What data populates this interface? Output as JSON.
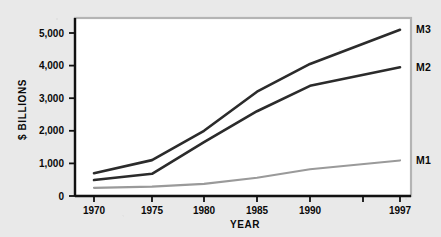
{
  "chart_data": {
    "type": "line",
    "title": "",
    "xlabel": "YEAR",
    "ylabel": "$ BILLIONS",
    "x": [
      1970,
      1975,
      1980,
      1985,
      1990,
      1997
    ],
    "categories": [
      "1970",
      "1975",
      "1980",
      "1985",
      "1990",
      "1997"
    ],
    "xtick_labels": [
      "1970",
      "1975",
      "1980",
      "1985",
      "1990",
      "1997"
    ],
    "ytick_labels": [
      "0",
      "1,000",
      "2,000",
      "3,000",
      "4,000",
      "5,000"
    ],
    "ytick_values": [
      0,
      1000,
      2000,
      3000,
      4000,
      5000
    ],
    "xlim": [
      1970,
      1997
    ],
    "ylim": [
      0,
      5600
    ],
    "grid": false,
    "legend": "inline-right-of-line-ends",
    "series": [
      {
        "name": "M3",
        "label": "M3",
        "color": "#2b2b2b",
        "width": 2.6,
        "values": [
          700,
          1100,
          2000,
          3200,
          4050,
          5100
        ]
      },
      {
        "name": "M2",
        "label": "M2",
        "color": "#2b2b2b",
        "width": 2.6,
        "values": [
          490,
          680,
          1650,
          2600,
          3380,
          3950
        ]
      },
      {
        "name": "M1",
        "label": "M1",
        "color": "#9a9a9a",
        "width": 2.2,
        "values": [
          250,
          290,
          370,
          560,
          820,
          1090
        ]
      }
    ],
    "annotations": [
      {
        "text": "M3",
        "for_series": "M3",
        "position": "right-end"
      },
      {
        "text": "M2",
        "for_series": "M2",
        "position": "right-end"
      },
      {
        "text": "M1",
        "for_series": "M1",
        "position": "right-end"
      }
    ]
  },
  "figure": {
    "background_color": "#e9e9e9",
    "plot_background_color": "#ffffff",
    "frame_color": "#b4b4b4",
    "axis_color": "#111111"
  }
}
